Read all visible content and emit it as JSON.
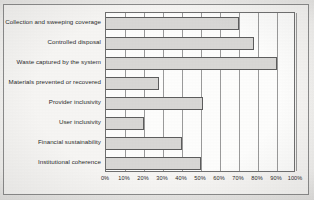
{
  "chart_data": {
    "type": "bar",
    "orientation": "horizontal",
    "title": "",
    "xlabel": "",
    "ylabel": "",
    "xlim": [
      0,
      100
    ],
    "grid": true,
    "legend": false,
    "categories": [
      "Collection and sweeping coverage",
      "Controlled disposal",
      "Waste captured by the system",
      "Materials prevented or recovered",
      "Provider inclusivity",
      "User inclusivity",
      "Financial sustainability",
      "Institutional coherence"
    ],
    "values": [
      70,
      78,
      90,
      28,
      51,
      20,
      40,
      50
    ],
    "tick_labels": [
      "0%",
      "10%",
      "20%",
      "30%",
      "40%",
      "50%",
      "60%",
      "70%",
      "80%",
      "90%",
      "100%"
    ],
    "tick_values": [
      0,
      10,
      20,
      30,
      40,
      50,
      60,
      70,
      80,
      90,
      100
    ],
    "bar_fill_color": "#d8d7d5",
    "bar_border_color": "#5d5d5d",
    "plot_background_color": "#fdfdfc",
    "axis_color": "#6f6f6f"
  }
}
